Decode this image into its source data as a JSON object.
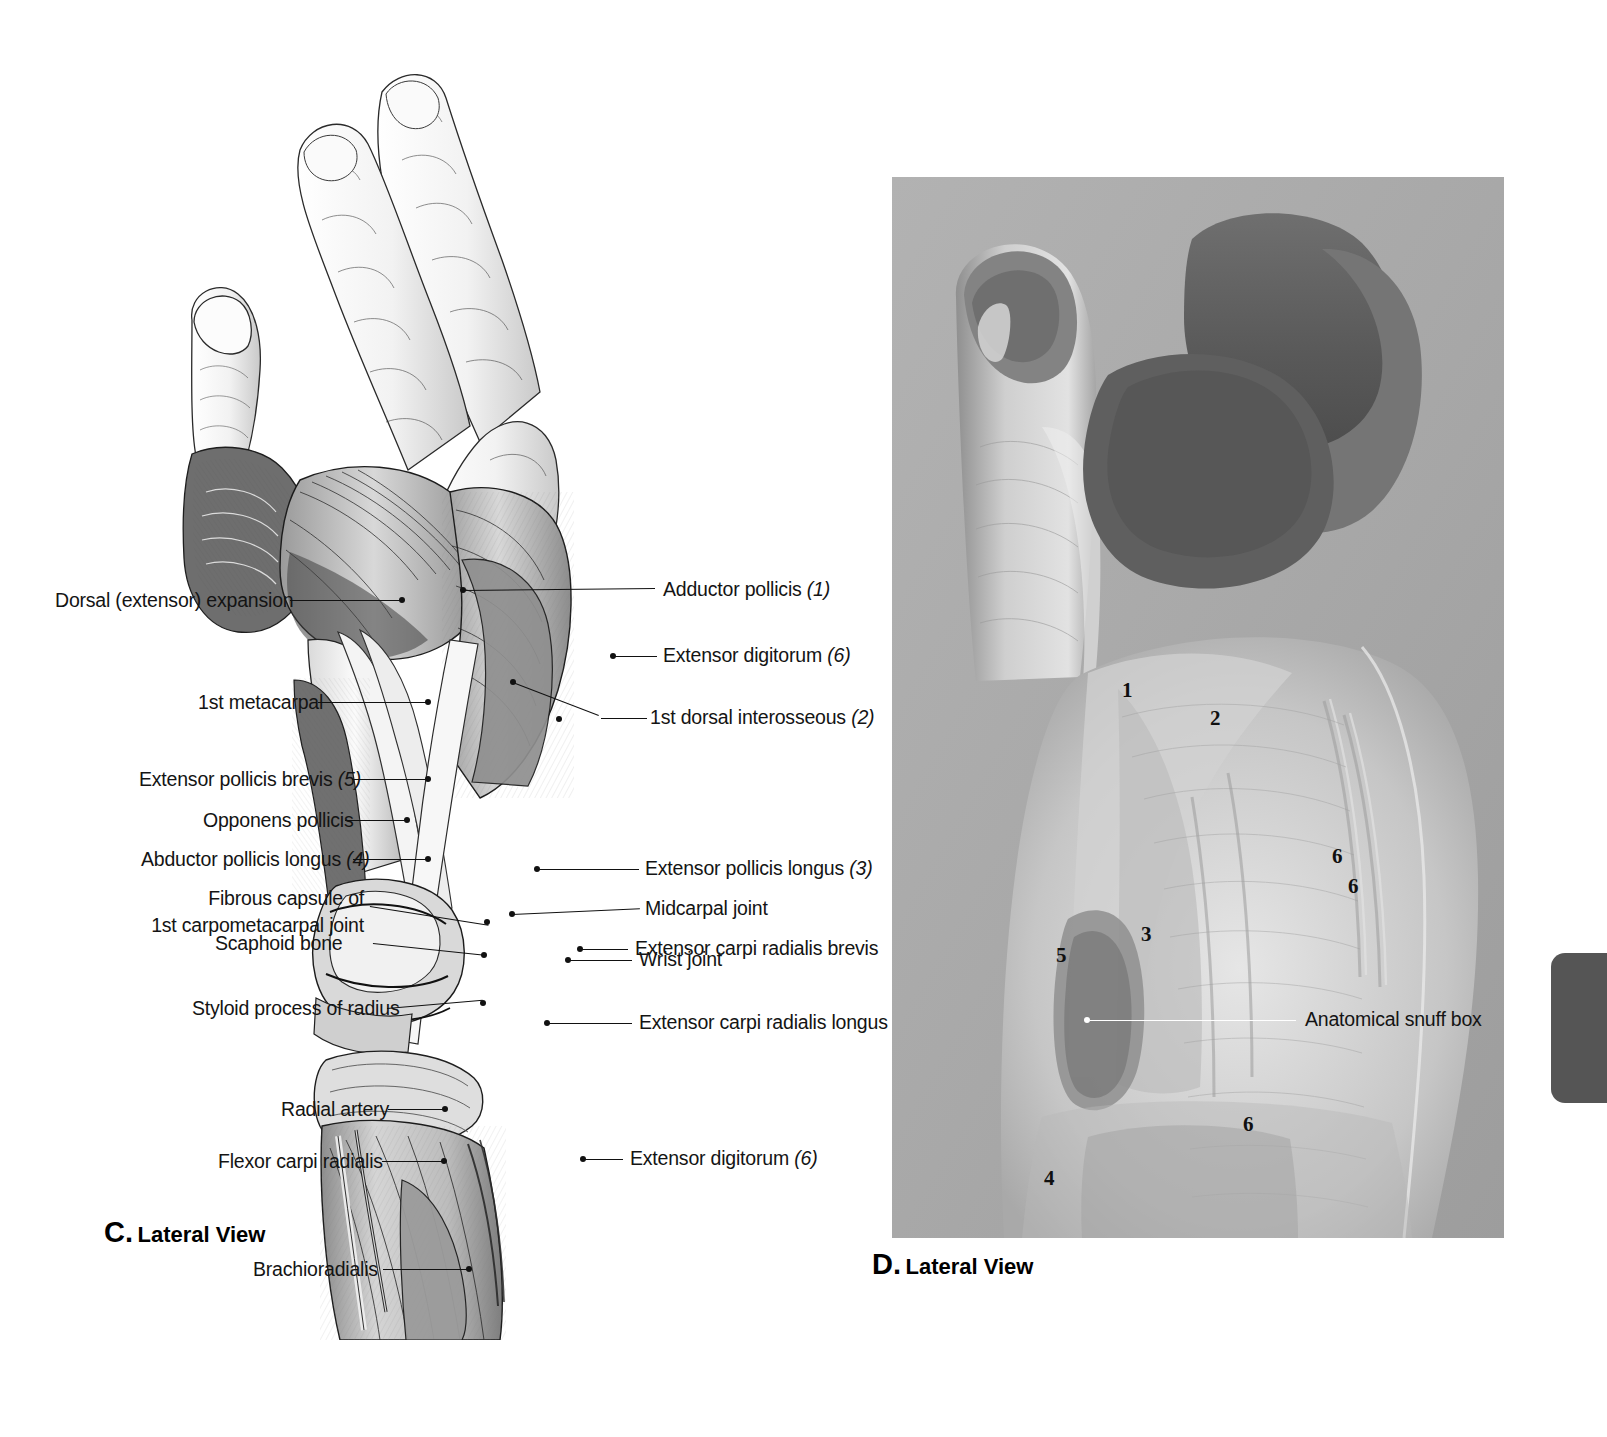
{
  "page": {
    "accent_dark": "#555555",
    "photo_bg": "#a6a6a6",
    "label_color": "#141414"
  },
  "panel_c": {
    "caption_letter": "C.",
    "caption_text": "Lateral View",
    "figure_name": "dissected-lateral-hand-wrist-illustration",
    "labels_left": [
      {
        "id": "dorsal-extensor-expansion",
        "text": "Dorsal (extensor) expansion",
        "suffix": ""
      },
      {
        "id": "first-metacarpal",
        "text": "1st metacarpal",
        "suffix": ""
      },
      {
        "id": "extensor-pollicis-brevis",
        "text": "Extensor pollicis brevis",
        "suffix": "(5)"
      },
      {
        "id": "opponens-pollicis",
        "text": "Opponens pollicis",
        "suffix": ""
      },
      {
        "id": "abductor-pollicis-longus",
        "text": "Abductor pollicis longus",
        "suffix": "(4)"
      },
      {
        "id": "fibrous-capsule-cmc",
        "text": "Fibrous capsule of\n1st carpometacarpal joint",
        "suffix": ""
      },
      {
        "id": "scaphoid-bone",
        "text": "Scaphoid bone",
        "suffix": ""
      },
      {
        "id": "styloid-process-of-radius",
        "text": "Styloid process of radius",
        "suffix": ""
      },
      {
        "id": "radial-artery",
        "text": "Radial artery",
        "suffix": ""
      },
      {
        "id": "flexor-carpi-radialis",
        "text": "Flexor carpi radialis",
        "suffix": ""
      },
      {
        "id": "brachioradialis",
        "text": "Brachioradialis",
        "suffix": ""
      }
    ],
    "labels_right": [
      {
        "id": "adductor-pollicis",
        "text": "Adductor pollicis",
        "suffix": "(1)"
      },
      {
        "id": "extensor-digitorum-upper",
        "text": "Extensor digitorum",
        "suffix": "(6)"
      },
      {
        "id": "first-dorsal-interosseous",
        "text": "1st dorsal interosseous",
        "suffix": "(2)"
      },
      {
        "id": "extensor-pollicis-longus",
        "text": "Extensor pollicis longus",
        "suffix": "(3)"
      },
      {
        "id": "midcarpal-joint",
        "text": "Midcarpal joint",
        "suffix": ""
      },
      {
        "id": "extensor-carpi-radialis-brevis",
        "text": "Extensor carpi radialis brevis",
        "suffix": ""
      },
      {
        "id": "wrist-joint",
        "text": "Wrist joint",
        "suffix": ""
      },
      {
        "id": "extensor-carpi-radialis-longus",
        "text": "Extensor carpi radialis longus",
        "suffix": ""
      },
      {
        "id": "extensor-digitorum-lower",
        "text": "Extensor digitorum",
        "suffix": "(6)"
      }
    ]
  },
  "panel_d": {
    "caption_letter": "D.",
    "caption_text": "Lateral View",
    "photo_name": "surface-anatomy-hand-photograph",
    "markers": [
      {
        "id": "marker-1",
        "value": "1"
      },
      {
        "id": "marker-2",
        "value": "2"
      },
      {
        "id": "marker-6-a",
        "value": "6"
      },
      {
        "id": "marker-6-b",
        "value": "6"
      },
      {
        "id": "marker-3",
        "value": "3"
      },
      {
        "id": "marker-5",
        "value": "5"
      },
      {
        "id": "marker-6-c",
        "value": "6"
      },
      {
        "id": "marker-4",
        "value": "4"
      }
    ],
    "label_snuff_box": "Anatomical snuff box"
  }
}
